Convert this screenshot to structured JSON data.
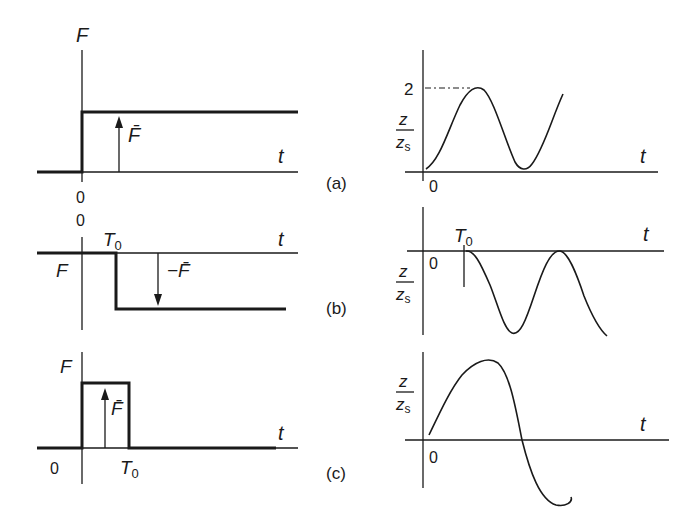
{
  "figure": {
    "panels": [
      {
        "id": "a",
        "label": "(a)",
        "force": {
          "y_label": "F",
          "x_label": "t",
          "origin_label": "0",
          "arrow_label": "F̄",
          "description": "Step force of magnitude F̄ applied at t = 0"
        },
        "response": {
          "y_label_num": "z",
          "y_label_den": "zs",
          "x_label": "t",
          "origin_label": "0",
          "peak_label": "2",
          "description": "Response oscillates between 0 and 2 times static deflection"
        }
      },
      {
        "id": "b",
        "label": "(b)",
        "force": {
          "y_label": "F",
          "x_label": "t",
          "origin_label": "0",
          "time_label": "T0",
          "arrow_label": "−F̄",
          "description": "Force of −F̄ applied at t = T0"
        },
        "response": {
          "y_label_num": "z",
          "y_label_den": "zs",
          "x_label": "t",
          "origin_label": "0",
          "time_label": "T0",
          "description": "Response starts at T0, oscillating between 0 and −2"
        }
      },
      {
        "id": "c",
        "label": "(c)",
        "force": {
          "y_label": "F",
          "x_label": "t",
          "origin_label": "0",
          "time_label": "T0",
          "arrow_label": "F̄",
          "description": "Rectangular pulse of magnitude F̄ from 0 to T0"
        },
        "response": {
          "y_label_num": "z",
          "y_label_den": "zs",
          "x_label": "t",
          "origin_label": "0",
          "description": "Superposition of (a) and (b): oscillation about zero"
        }
      }
    ],
    "subscripts": {
      "T0_sub": "0",
      "zs_sub": "s"
    }
  }
}
